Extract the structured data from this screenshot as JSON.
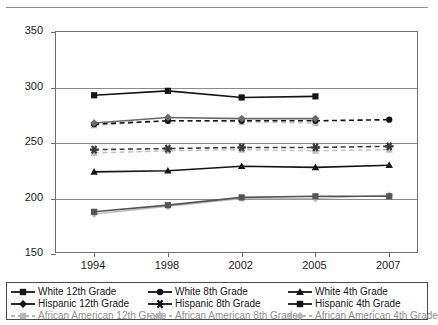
{
  "header": {
    "cropped_text": ""
  },
  "chart_data": {
    "type": "line",
    "title": "",
    "subtitle": "",
    "xlabel": "",
    "ylabel": "",
    "x": [
      "1994",
      "1998",
      "2002",
      "2005",
      "2007"
    ],
    "xlim": [
      0,
      4
    ],
    "ylim": [
      150,
      350
    ],
    "yticks": [
      150,
      200,
      250,
      300,
      350
    ],
    "grid": true,
    "legend_position": "bottom",
    "series": [
      {
        "name": "White 12th Grade",
        "marker": "square",
        "color": "#151515",
        "line": "solid",
        "x": [
          "1994",
          "1998",
          "2002",
          "2005"
        ],
        "values": [
          293,
          297,
          291,
          292
        ]
      },
      {
        "name": "White 8th Grade",
        "marker": "circle",
        "color": "#151515",
        "line": "dashed",
        "x": [
          "1994",
          "1998",
          "2002",
          "2005",
          "2007"
        ],
        "values": [
          267,
          270,
          270,
          270,
          271
        ]
      },
      {
        "name": "White 4th Grade",
        "marker": "triangle",
        "color": "#151515",
        "line": "solid",
        "x": [
          "1994",
          "1998",
          "2002",
          "2005",
          "2007"
        ],
        "values": [
          224,
          225,
          229,
          228,
          230
        ]
      },
      {
        "name": "Hispanic 12th Grade",
        "marker": "diamond",
        "color": "#6a6a6a",
        "line": "solid",
        "x": [
          "1994",
          "1998",
          "2002",
          "2005"
        ],
        "values": [
          268,
          273,
          272,
          272
        ]
      },
      {
        "name": "Hispanic 8th Grade",
        "marker": "asterisk",
        "color": "#3a3a3a",
        "line": "dashed",
        "x": [
          "1994",
          "1998",
          "2002",
          "2005",
          "2007"
        ],
        "values": [
          244,
          245,
          246,
          246,
          247
        ]
      },
      {
        "name": "Hispanic 4th Grade",
        "marker": "square",
        "color": "#555555",
        "line": "solid",
        "x": [
          "1994",
          "1998",
          "2002",
          "2005",
          "2007"
        ],
        "values": [
          188,
          194,
          201,
          202,
          202
        ]
      },
      {
        "name": "African American 12th Grade",
        "marker": "square",
        "color": "#c0c0c0",
        "line": "dashed",
        "x": [
          "1994",
          "1998",
          "2002",
          "2005"
        ],
        "values": [
          266,
          270,
          269,
          268
        ]
      },
      {
        "name": "African American 8th Grade",
        "marker": "square",
        "color": "#c0c0c0",
        "line": "dashed",
        "x": [
          "1994",
          "1998",
          "2002",
          "2005",
          "2007"
        ],
        "values": [
          241,
          243,
          244,
          243,
          244
        ]
      },
      {
        "name": "African American 4th Grade",
        "marker": "diamond",
        "color": "#bdbdbd",
        "line": "solid",
        "x": [
          "1994",
          "1998",
          "2002",
          "2005",
          "2007"
        ],
        "values": [
          186,
          193,
          200,
          200,
          203
        ]
      }
    ]
  },
  "legend": {
    "rows": [
      [
        {
          "label": "White 12th Grade",
          "marker": "square",
          "color": "#151515",
          "line": "solid"
        },
        {
          "label": "White 8th Grade",
          "marker": "circle",
          "color": "#151515",
          "line": "solid"
        },
        {
          "label": "White 4th Grade",
          "marker": "triangle",
          "color": "#151515",
          "line": "solid"
        }
      ],
      [
        {
          "label": "Hispanic 12th Grade",
          "marker": "diamond",
          "color": "#151515",
          "line": "solid"
        },
        {
          "label": "Hispanic 8th Grade",
          "marker": "asterisk",
          "color": "#151515",
          "line": "solid"
        },
        {
          "label": "Hispanic 4th Grade",
          "marker": "square",
          "color": "#151515",
          "line": "solid"
        }
      ],
      [
        {
          "label": "African American 12th Grade",
          "marker": "square",
          "color": "#b6b6b6",
          "line": "dashed"
        },
        {
          "label": "African American 8th Grade",
          "marker": "square",
          "color": "#b6b6b6",
          "line": "dashed"
        },
        {
          "label": "African American 4th Grade",
          "marker": "diamond",
          "color": "#b6b6b6",
          "line": "dashed"
        }
      ]
    ]
  }
}
